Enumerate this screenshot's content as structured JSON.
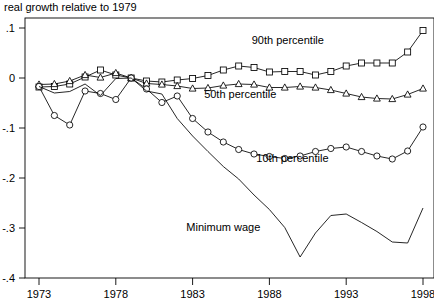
{
  "chart_data": {
    "type": "line",
    "title": "real growth relative to 1979",
    "xlabel": "",
    "ylabel": "",
    "xlim": [
      1973,
      1998
    ],
    "ylim": [
      -0.4,
      0.1
    ],
    "grid": false,
    "legend_position": "inline-annotations",
    "xticks": [
      "1973",
      "1978",
      "1983",
      "1988",
      "1993",
      "1998"
    ],
    "xtick_values": [
      1973,
      1978,
      1983,
      1988,
      1993,
      1998
    ],
    "yticks": [
      ".1",
      "0",
      "-.1",
      "-.2",
      "-.3",
      "-.4"
    ],
    "ytick_values": [
      0.1,
      0,
      -0.1,
      -0.2,
      -0.3,
      -0.4
    ],
    "x": [
      1973,
      1974,
      1975,
      1976,
      1977,
      1978,
      1979,
      1980,
      1981,
      1982,
      1983,
      1984,
      1985,
      1986,
      1987,
      1988,
      1989,
      1990,
      1991,
      1992,
      1993,
      1994,
      1995,
      1996,
      1997,
      1998
    ],
    "series": [
      {
        "name": "90th percentile",
        "marker": "square",
        "label": "90th percentile",
        "label_x": 1989.2,
        "label_y": 0.068,
        "values": [
          -0.018,
          -0.017,
          -0.012,
          0.002,
          0.016,
          0.006,
          0.0,
          -0.006,
          -0.008,
          -0.004,
          -0.001,
          0.005,
          0.016,
          0.024,
          0.021,
          0.012,
          0.013,
          0.013,
          0.006,
          0.013,
          0.024,
          0.03,
          0.03,
          0.03,
          0.052,
          0.095
        ]
      },
      {
        "name": "50th percentile",
        "marker": "triangle",
        "label": "50th percentile",
        "label_x": 1986.1,
        "label_y": -0.04,
        "values": [
          -0.013,
          -0.012,
          -0.006,
          0.006,
          0.001,
          0.01,
          0.0,
          -0.011,
          -0.013,
          -0.016,
          -0.021,
          -0.02,
          -0.015,
          -0.012,
          -0.013,
          -0.019,
          -0.019,
          -0.017,
          -0.019,
          -0.024,
          -0.031,
          -0.038,
          -0.041,
          -0.042,
          -0.033,
          -0.021
        ]
      },
      {
        "name": "10th percentile",
        "marker": "circle",
        "label": "10th percentile",
        "label_x": 1989.5,
        "label_y": -0.167,
        "values": [
          -0.017,
          -0.075,
          -0.094,
          -0.026,
          -0.031,
          -0.043,
          0.0,
          -0.022,
          -0.049,
          -0.036,
          -0.081,
          -0.108,
          -0.128,
          -0.143,
          -0.152,
          -0.157,
          -0.161,
          -0.156,
          -0.147,
          -0.141,
          -0.138,
          -0.147,
          -0.156,
          -0.162,
          -0.146,
          -0.098
        ]
      },
      {
        "name": "Minimum wage",
        "marker": "none",
        "label": "Minimum wage",
        "label_x": 1985.0,
        "label_y": -0.305,
        "values": [
          -0.017,
          -0.03,
          -0.027,
          -0.012,
          -0.035,
          -0.001,
          0.0,
          -0.026,
          -0.032,
          -0.081,
          -0.116,
          -0.147,
          -0.177,
          -0.202,
          -0.234,
          -0.263,
          -0.299,
          -0.358,
          -0.31,
          -0.275,
          -0.272,
          -0.289,
          -0.307,
          -0.328,
          -0.33,
          -0.26
        ]
      }
    ]
  }
}
